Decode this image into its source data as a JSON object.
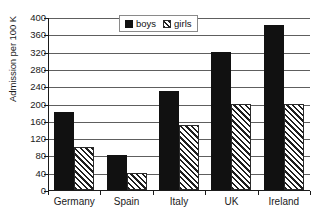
{
  "chart_data": {
    "type": "bar",
    "title": "",
    "subtitle": "",
    "xlabel": "",
    "ylabel": "Admission per 100 K",
    "categories": [
      "Germany",
      "Spain",
      "Italy",
      "UK",
      "Ireland"
    ],
    "series": [
      {
        "name": "boys",
        "values": [
          180,
          80,
          230,
          320,
          382
        ],
        "style": "solid-black",
        "color": "#111111"
      },
      {
        "name": "girls",
        "values": [
          100,
          40,
          150,
          200,
          200
        ],
        "style": "diagonal-hatch",
        "color": "#1f1f1f"
      }
    ],
    "ylim": [
      0,
      400
    ],
    "ytick_step": 40,
    "yticks": [
      0,
      40,
      80,
      120,
      160,
      200,
      240,
      280,
      320,
      360,
      400
    ],
    "ytick_labels": [
      "0",
      "40",
      "80",
      "120",
      "160",
      "200",
      "240",
      "280",
      "320",
      "360",
      "400"
    ],
    "grid": true,
    "grid_axis": "y",
    "legend": [
      "boys",
      "girls"
    ],
    "legend_position": "top-center",
    "legend_boxed": true,
    "bar_grouping": "grouped",
    "palette": {
      "series_boys": "#111111",
      "series_girls": "#1f1f1f",
      "gridline": "#5e5e5e",
      "axis": "#1a1a1a",
      "background": "#ffffff"
    }
  }
}
